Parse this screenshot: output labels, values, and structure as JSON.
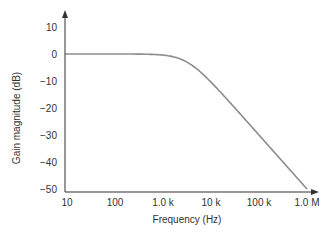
{
  "chart_data": {
    "type": "line",
    "title": "",
    "xlabel": "Frequency (Hz)",
    "ylabel": "Gain magnitude (dB)",
    "xscale": "log",
    "xlim": [
      10,
      1000000
    ],
    "ylim": [
      -50,
      10
    ],
    "grid": false,
    "legend": null,
    "x_ticks": [
      {
        "value": 10,
        "label": "10"
      },
      {
        "value": 100,
        "label": "100"
      },
      {
        "value": 1000,
        "label": "1.0 k"
      },
      {
        "value": 10000,
        "label": "10 k"
      },
      {
        "value": 100000,
        "label": "100 k"
      },
      {
        "value": 1000000,
        "label": "1.0 M"
      }
    ],
    "y_ticks": [
      {
        "value": 10,
        "label": "10"
      },
      {
        "value": 0,
        "label": "0"
      },
      {
        "value": -10,
        "label": "−10"
      },
      {
        "value": -20,
        "label": "−20"
      },
      {
        "value": -30,
        "label": "−30"
      },
      {
        "value": -40,
        "label": "−40"
      },
      {
        "value": -50,
        "label": "−50"
      }
    ],
    "series": [
      {
        "name": "Low-pass gain response",
        "color": "#8c8c8c",
        "corner_frequency_hz": 3160,
        "x": [
          10,
          100,
          300,
          1000,
          2000,
          3160,
          5000,
          10000,
          30000,
          100000,
          300000,
          1000000
        ],
        "values": [
          0,
          0,
          0,
          -0.4,
          -1.5,
          -3.0,
          -5.5,
          -10.4,
          -19.6,
          -30.0,
          -39.5,
          -50.0
        ]
      }
    ]
  },
  "colors": {
    "axis": "#333333",
    "curve": "#8c8c8c",
    "text": "#333333",
    "background": "#ffffff"
  }
}
